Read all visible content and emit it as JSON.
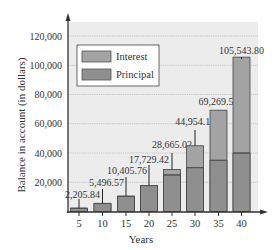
{
  "chart_data": {
    "type": "bar",
    "stacked": true,
    "title": "",
    "xlabel": "Years",
    "ylabel": "Balance in account (in dollars)",
    "categories": [
      "5",
      "10",
      "15",
      "20",
      "25",
      "30",
      "35",
      "40"
    ],
    "series": [
      {
        "name": "Principal",
        "values": [
          5000,
          10000,
          15000,
          20000,
          25000,
          30000,
          35000,
          40000
        ],
        "color": "#8f8f8f"
      },
      {
        "name": "Interest",
        "values": [
          -2794.16,
          -4503.43,
          -4594.24,
          -2270.58,
          3665.02,
          14954.11,
          34269.5,
          65543.8
        ],
        "color": "#a3a3a3"
      }
    ],
    "totals": [
      2205.84,
      5496.57,
      10405.76,
      17729.42,
      28665.02,
      44954.11,
      69269.5,
      105543.8
    ],
    "total_labels": [
      "2,205.84",
      "5,496.57",
      "10,405.76",
      "17,729.42",
      "28,665.02",
      "44,954.11",
      "69,269.50",
      "105,543.80"
    ],
    "ylim": [
      0,
      120000
    ],
    "yticks": [
      20000,
      40000,
      60000,
      80000,
      100000,
      120000
    ],
    "ytick_labels": [
      "20,000",
      "40,000",
      "60,000",
      "80,000",
      "100,000",
      "120,000"
    ],
    "grid": true,
    "legend_position": "upper left"
  },
  "legend": {
    "items": [
      {
        "label": "Interest",
        "color": "#a3a3a3"
      },
      {
        "label": "Principal",
        "color": "#8f8f8f"
      }
    ]
  },
  "colors": {
    "plot_bg": "#ececec",
    "grid": "#b8b8b8",
    "axis": "#333333",
    "bar_outline": "#444444",
    "divider": "#555555"
  }
}
